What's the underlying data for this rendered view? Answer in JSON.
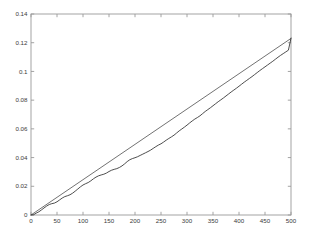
{
  "chart_data": {
    "type": "line",
    "title": "",
    "subtitle": "",
    "xlabel": "",
    "ylabel": "",
    "xlim": [
      0,
      500
    ],
    "ylim": [
      0,
      0.14
    ],
    "grid": false,
    "legend": null,
    "legend_position": "none",
    "x_ticks": [
      0,
      50,
      100,
      150,
      200,
      250,
      300,
      350,
      400,
      450,
      500
    ],
    "x_tick_labels": [
      "0",
      "50",
      "100",
      "150",
      "200",
      "250",
      "300",
      "350",
      "400",
      "450",
      "500"
    ],
    "y_ticks": [
      0,
      0.02,
      0.04,
      0.06,
      0.08,
      0.1,
      0.12,
      0.14
    ],
    "y_tick_labels": [
      "0",
      "0.02",
      "0.04",
      "0.06",
      "0.08",
      "0.1",
      "0.12",
      "0.14"
    ],
    "colors": {
      "axis": "#9a9a9a",
      "tick_text": "#3a3a3a",
      "series_smooth": "#595959",
      "series_noisy": "#2e2e2e",
      "background": "#ffffff"
    },
    "series": [
      {
        "name": "smooth-reference-line",
        "style": "solid",
        "color": "#595959",
        "x": [
          0,
          25,
          50,
          75,
          100,
          125,
          150,
          175,
          200,
          225,
          250,
          275,
          300,
          325,
          350,
          375,
          400,
          425,
          450,
          475,
          500
        ],
        "values": [
          0.0,
          0.00615,
          0.0123,
          0.01845,
          0.0246,
          0.03075,
          0.0369,
          0.04305,
          0.0492,
          0.05535,
          0.0615,
          0.06765,
          0.0738,
          0.07995,
          0.0861,
          0.09225,
          0.0984,
          0.10455,
          0.1107,
          0.11685,
          0.123
        ]
      },
      {
        "name": "noisy-empirical-curve",
        "style": "solid",
        "color": "#2e2e2e",
        "x": [
          0,
          5,
          10,
          15,
          20,
          25,
          30,
          35,
          40,
          45,
          50,
          55,
          60,
          65,
          70,
          75,
          80,
          85,
          90,
          95,
          100,
          105,
          110,
          115,
          120,
          125,
          130,
          135,
          140,
          145,
          150,
          155,
          160,
          165,
          170,
          175,
          180,
          185,
          190,
          195,
          200,
          205,
          210,
          215,
          220,
          225,
          230,
          235,
          240,
          245,
          250,
          255,
          260,
          265,
          270,
          275,
          280,
          285,
          290,
          295,
          300,
          305,
          310,
          315,
          320,
          325,
          330,
          335,
          340,
          345,
          350,
          355,
          360,
          365,
          370,
          375,
          380,
          385,
          390,
          395,
          400,
          405,
          410,
          415,
          420,
          425,
          430,
          435,
          440,
          445,
          450,
          455,
          460,
          465,
          470,
          475,
          480,
          485,
          490,
          495,
          500
        ],
        "values": [
          0.0,
          0.0002,
          0.0013,
          0.0022,
          0.0035,
          0.0049,
          0.0062,
          0.0073,
          0.0079,
          0.0083,
          0.0092,
          0.0105,
          0.0118,
          0.0128,
          0.0134,
          0.0141,
          0.0152,
          0.0166,
          0.0181,
          0.0196,
          0.0209,
          0.0218,
          0.0226,
          0.0238,
          0.0252,
          0.0264,
          0.0273,
          0.0279,
          0.0284,
          0.0292,
          0.0303,
          0.0312,
          0.0318,
          0.0323,
          0.0331,
          0.0342,
          0.0356,
          0.0372,
          0.0385,
          0.0393,
          0.0399,
          0.0406,
          0.0415,
          0.0424,
          0.0433,
          0.0442,
          0.0452,
          0.0464,
          0.0476,
          0.0487,
          0.0496,
          0.0508,
          0.0521,
          0.0533,
          0.0544,
          0.0556,
          0.0571,
          0.0586,
          0.0599,
          0.0612,
          0.0626,
          0.0641,
          0.0655,
          0.0668,
          0.0679,
          0.0691,
          0.0706,
          0.0721,
          0.0734,
          0.0747,
          0.0761,
          0.0775,
          0.0789,
          0.0802,
          0.0815,
          0.0829,
          0.0843,
          0.0857,
          0.087,
          0.0883,
          0.0897,
          0.0911,
          0.0925,
          0.0938,
          0.0951,
          0.0964,
          0.0978,
          0.0992,
          0.1006,
          0.1019,
          0.1032,
          0.1045,
          0.1058,
          0.1071,
          0.1085,
          0.1099,
          0.1112,
          0.1124,
          0.1136,
          0.1148,
          0.1232
        ]
      }
    ]
  }
}
